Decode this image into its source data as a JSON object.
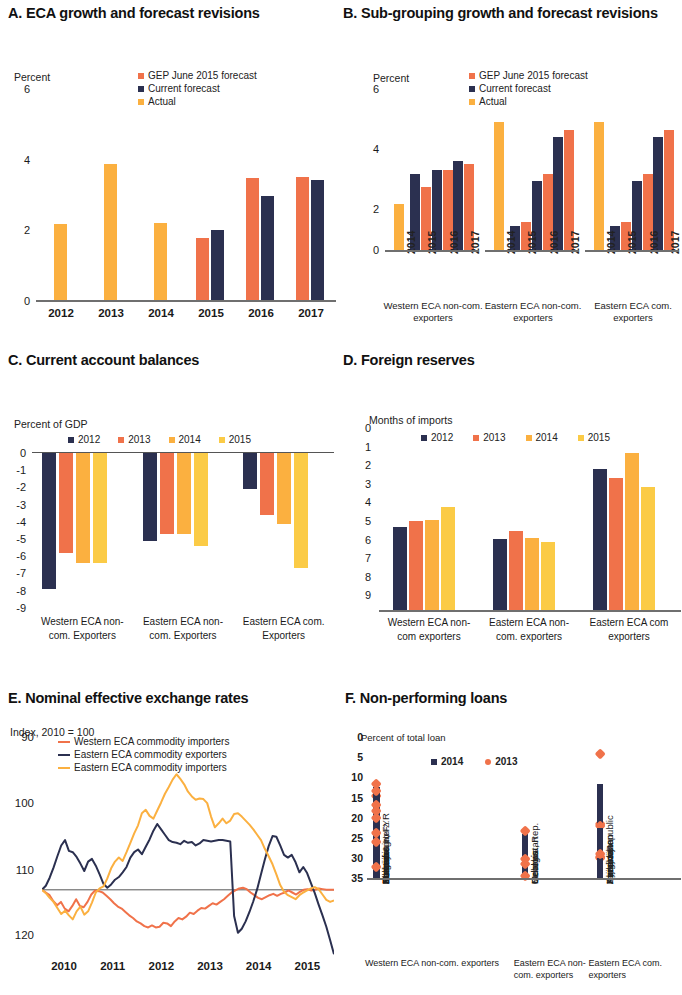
{
  "colors": {
    "orange_red": "#F0724A",
    "navy": "#2B3050",
    "amber": "#FBB040",
    "yellow": "#FBCB46",
    "axis": "#6f6f6f"
  },
  "panels": {
    "A": {
      "title": "A. ECA growth and forecast revisions",
      "axis_label": "Percent",
      "legend": [
        "GEP June 2015 forecast",
        "Current forecast",
        "Actual"
      ],
      "yticks": [
        "6",
        "4",
        "2",
        "0"
      ]
    },
    "B": {
      "title": "B. Sub-grouping growth and forecast revisions",
      "axis_label": "Percent",
      "legend": [
        "GEP June 2015 forecast",
        "Current forecast",
        "Actual"
      ],
      "yticks": [
        "6",
        "4",
        "2",
        "0"
      ],
      "groups": [
        "Western ECA non-com. exporters",
        "Eastern ECA non-com. exporters",
        "Eastern ECA com. exporters"
      ]
    },
    "C": {
      "title": "C. Current account balances",
      "axis_label": "Percent of GDP",
      "legend": [
        "2012",
        "2013",
        "2014",
        "2015"
      ],
      "yticks": [
        "0",
        "-1",
        "-2",
        "-3",
        "-4",
        "-5",
        "-6",
        "-7",
        "-8",
        "-9"
      ],
      "groups": [
        "Western ECA non-com. Exporters",
        "Eastern ECA non-com. Exporters",
        "Eastern ECA com. Exporters"
      ]
    },
    "D": {
      "title": "D. Foreign reserves",
      "axis_label": "Months of imports",
      "legend": [
        "2012",
        "2013",
        "2014",
        "2015"
      ],
      "yticks": [
        "9.0",
        "8.0",
        "7.0",
        "6.0",
        "5.0",
        "4.0",
        "3.0",
        "2.0",
        "1.0",
        "0.0"
      ],
      "groups": [
        "Western ECA non-com exporters",
        "Eastern ECA non-com. exporters",
        "Eastern ECA com exporters"
      ]
    },
    "E": {
      "title": "E. Nominal effective exchange rates",
      "axis_label": "Index, 2010 = 100",
      "legend": [
        "Western  ECA commodity importers",
        "Eastern ECA commodity exporters",
        "Eastern ECA commodity importers"
      ],
      "yticks": [
        "120",
        "110",
        "100",
        "90"
      ],
      "xticks": [
        "2010",
        "2011",
        "2012",
        "2013",
        "2014",
        "2015"
      ]
    },
    "F": {
      "title": "F. Non-performing loans",
      "axis_label": "Percent of total loan",
      "legend": [
        "2014",
        "2013"
      ],
      "yticks": [
        "35",
        "30",
        "25",
        "20",
        "15",
        "10",
        "5",
        "0"
      ],
      "groups": [
        "Western ECA non-com. exporters",
        "Eastern ECA non-com. exporters",
        "Eastern ECA com. exporters"
      ]
    }
  },
  "chart_data": [
    {
      "panel": "A",
      "type": "bar",
      "title": "A. ECA growth and forecast revisions",
      "ylabel": "Percent",
      "xlabel": "",
      "ylim": [
        0,
        6
      ],
      "yticks": [
        0,
        2,
        4,
        6
      ],
      "categories": [
        "2012",
        "2013",
        "2014",
        "2015",
        "2016",
        "2017"
      ],
      "series": [
        {
          "name": "GEP June 2015 forecast",
          "color": "#F0724A",
          "values": [
            null,
            null,
            null,
            1.8,
            3.5,
            3.55
          ]
        },
        {
          "name": "Current forecast",
          "color": "#2B3050",
          "values": [
            null,
            null,
            null,
            2.05,
            3.0,
            3.45
          ]
        },
        {
          "name": "Actual",
          "color": "#FBB040",
          "values": [
            2.2,
            3.9,
            2.25,
            null,
            null,
            null
          ]
        }
      ]
    },
    {
      "panel": "B",
      "type": "bar",
      "title": "B. Sub-grouping growth and forecast revisions",
      "ylabel": "Percent",
      "ylim": [
        0,
        6
      ],
      "yticks": [
        0,
        2,
        4,
        6
      ],
      "groups": [
        {
          "name": "Western ECA non-com. exporters",
          "categories": [
            "2014",
            "2015",
            "2016",
            "2017"
          ],
          "actual": [
            1.7,
            null,
            null,
            null
          ],
          "current_forecast": [
            null,
            2.8,
            2.95,
            3.3
          ],
          "gep_forecast": [
            null,
            2.35,
            2.95,
            3.2
          ]
        },
        {
          "name": "Eastern ECA non-com. exporters",
          "categories": [
            "2014",
            "2015",
            "2016",
            "2017"
          ],
          "actual": [
            4.75,
            null,
            null,
            null
          ],
          "current_forecast": [
            null,
            0.9,
            2.55,
            4.2
          ],
          "gep_forecast": [
            null,
            1.05,
            2.8,
            4.45
          ]
        },
        {
          "name": "Eastern ECA com. exporters",
          "categories": [
            "2014",
            "2015",
            "2016",
            "2017"
          ],
          "actual": [
            4.75,
            null,
            null,
            null
          ],
          "current_forecast": [
            null,
            0.9,
            2.55,
            4.2
          ],
          "gep_forecast": [
            null,
            1.05,
            2.8,
            4.45
          ]
        }
      ]
    },
    {
      "panel": "C",
      "type": "bar",
      "title": "C. Current account balances",
      "ylabel": "Percent of GDP",
      "ylim": [
        -9,
        0
      ],
      "yticks": [
        0,
        -1,
        -2,
        -3,
        -4,
        -5,
        -6,
        -7,
        -8,
        -9
      ],
      "categories": [
        "Western ECA non-com. Exporters",
        "Eastern ECA non-com. Exporters",
        "Eastern ECA com. Exporters"
      ],
      "series": [
        {
          "name": "2012",
          "color": "#2B3050",
          "values": [
            -7.9,
            -5.1,
            -2.1
          ]
        },
        {
          "name": "2013",
          "color": "#F0724A",
          "values": [
            -5.8,
            -4.7,
            -3.6
          ]
        },
        {
          "name": "2014",
          "color": "#FBB040",
          "values": [
            -6.4,
            -4.7,
            -4.1
          ]
        },
        {
          "name": "2015",
          "color": "#FBCB46",
          "values": [
            -6.4,
            -5.4,
            -6.7
          ]
        }
      ]
    },
    {
      "panel": "D",
      "type": "bar",
      "title": "D. Foreign reserves",
      "ylabel": "Months of imports",
      "ylim": [
        0,
        9
      ],
      "yticks": [
        0,
        1,
        2,
        3,
        4,
        5,
        6,
        7,
        8,
        9
      ],
      "categories": [
        "Western ECA non-com exporters",
        "Eastern ECA non-com. exporters",
        "Eastern ECA com exporters"
      ],
      "series": [
        {
          "name": "2012",
          "color": "#2B3050",
          "values": [
            4.1,
            3.5,
            6.95
          ]
        },
        {
          "name": "2013",
          "color": "#F0724A",
          "values": [
            4.4,
            3.9,
            6.55
          ]
        },
        {
          "name": "2014",
          "color": "#FBB040",
          "values": [
            4.45,
            3.55,
            7.75
          ]
        },
        {
          "name": "2015",
          "color": "#FBCB46",
          "values": [
            5.1,
            3.35,
            6.1
          ]
        }
      ]
    },
    {
      "panel": "E",
      "type": "line",
      "title": "E. Nominal effective exchange rates",
      "ylabel": "Index, 2010 = 100",
      "ylim": [
        90,
        122
      ],
      "yticks": [
        90,
        100,
        110,
        120
      ],
      "xticks": [
        "2010",
        "2011",
        "2012",
        "2013",
        "2014",
        "2015"
      ],
      "xlim": [
        2010,
        2015.9
      ],
      "series": [
        {
          "name": "Western  ECA commodity importers",
          "color": "#F0724A",
          "values": [
            100,
            99.6,
            99.2,
            98.3,
            97.7,
            98.2,
            97.2,
            96.8,
            97.6,
            98.6,
            97.6,
            97.4,
            98.2,
            99.3,
            99.9,
            99.8,
            99.6,
            99.1,
            98.6,
            98,
            97.5,
            97.2,
            96.7,
            96.2,
            95.8,
            95.3,
            95,
            94.6,
            94.4,
            94.7,
            94.4,
            94.5,
            95.1,
            95,
            94.6,
            95.3,
            95.8,
            95.6,
            96,
            96.6,
            96.4,
            96.9,
            97.3,
            97.2,
            97.6,
            98,
            97.8,
            98.2,
            98.6,
            99.1,
            99.6,
            99.9,
            100.2,
            100.3,
            100.1,
            99.6,
            99.2,
            98.8,
            98.6,
            98.9,
            99.2,
            99.4,
            99.1,
            99.4,
            99.6,
            99.9,
            99.6,
            99.3,
            99.7,
            100,
            100.1,
            99.9,
            100,
            100.2,
            100.1,
            100,
            100,
            100
          ]
        },
        {
          "name": "Eastern ECA commodity exporters",
          "color": "#2B3050",
          "values": [
            100,
            100.6,
            101.8,
            103.3,
            105,
            106.6,
            107.4,
            105.8,
            105.6,
            104.9,
            103.9,
            102.8,
            104.2,
            104.6,
            103.6,
            102.3,
            100.9,
            100.3,
            100.8,
            101.5,
            101.9,
            102.6,
            103.4,
            104.8,
            105.6,
            106,
            105.3,
            106.4,
            107.5,
            108.8,
            109.8,
            109,
            108.2,
            107.4,
            107.1,
            107,
            106.8,
            107.3,
            107,
            107.1,
            106.6,
            106.9,
            107.4,
            107.3,
            107.2,
            107.3,
            107.4,
            107.4,
            107.3,
            107.2,
            96.1,
            93.6,
            94.2,
            95.3,
            96.7,
            98.3,
            100.1,
            102.3,
            104.5,
            106.5,
            108,
            107.9,
            106.6,
            105.2,
            104.8,
            105.2,
            104.1,
            102.6,
            103.4,
            102.5,
            101,
            99.5,
            97.8,
            96.2,
            94.5,
            92.5,
            90.4
          ]
        },
        {
          "name": "Eastern ECA commodity importers",
          "color": "#FBB040",
          "values": [
            100,
            99.5,
            98.8,
            98.2,
            97.3,
            96.4,
            96.9,
            96.2,
            95.6,
            96.8,
            97.5,
            96.3,
            96.8,
            98.1,
            99.6,
            100.2,
            100.5,
            101.7,
            103.2,
            104.2,
            104.8,
            104.3,
            105.6,
            107,
            108.4,
            109.6,
            111.4,
            111.9,
            111,
            110.6,
            111.8,
            113,
            114.3,
            115.3,
            116.4,
            117.2,
            116.5,
            115.7,
            114.6,
            113.9,
            113.4,
            113.6,
            113.5,
            112.9,
            110.9,
            109.3,
            109.9,
            110.6,
            109.9,
            110.3,
            111.3,
            111.4,
            110.9,
            110.3,
            109.7,
            109,
            108.2,
            107.4,
            106.1,
            105,
            103.8,
            102.3,
            100.7,
            99.7,
            99.2,
            98.9,
            98.6,
            99.2,
            99.6,
            99.9,
            100.2,
            100.4,
            100.1,
            99.3,
            98.5,
            98.2,
            98.4
          ]
        }
      ]
    },
    {
      "panel": "F",
      "type": "bar",
      "title": "F. Non-performing loans",
      "ylabel": "Percent of total loan",
      "ylim": [
        0,
        35
      ],
      "yticks": [
        0,
        5,
        10,
        15,
        20,
        25,
        30,
        35
      ],
      "groups": [
        {
          "name": "Western ECA non-com. exporters",
          "categories": [
            "Serbia",
            "Albania",
            "Montenegro",
            "Bulgaria",
            "Romania",
            "Bosnia & Herz.",
            "Macedonia, FYR",
            "Kosovo",
            "Turkey"
          ],
          "v2014": [
            21.5,
            22.8,
            17.0,
            16.2,
            15.0,
            14.0,
            10.5,
            8.3,
            2.5
          ],
          "v2013": [
            20.5,
            23.5,
            18.3,
            16.7,
            21.8,
            15.0,
            11.2,
            9.0,
            2.7
          ]
        },
        {
          "name": "Eastern ECA non-com. exporters",
          "categories": [
            "Moldova, Rep.",
            "Belarus",
            "Georgia",
            "Uzbekistan"
          ],
          "v2014": [
            11.0,
            4.4,
            2.8,
            0.4
          ],
          "v2013": [
            11.8,
            4.8,
            3.4,
            0.4
          ]
        },
        {
          "name": "Eastern ECA com. exporters",
          "categories": [
            "Kazakhstan",
            "Tajikistan",
            "Ukraine",
            "Azerbaijan",
            "Armenia",
            "Kyrgyz Republic"
          ],
          "v2014": [
            23.5,
            21.0,
            19.0,
            12.5,
            7.0,
            5.0
          ],
          "v2013": [
            31.0,
            13.5,
            13.0,
            5.0,
            5.2,
            6.0
          ]
        }
      ]
    }
  ]
}
